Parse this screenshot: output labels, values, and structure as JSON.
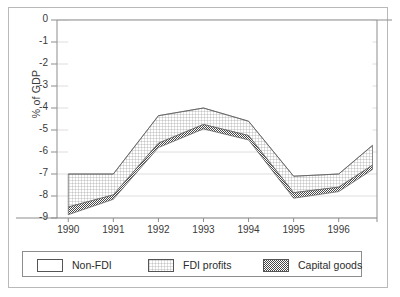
{
  "chart_data": {
    "type": "area",
    "title": "",
    "subtitle": "",
    "xlabel": "",
    "ylabel": "% of GDP",
    "xlim": [
      1989.75,
      1996.85
    ],
    "ylim": [
      -9,
      0
    ],
    "y_ticks": [
      "0",
      "-1",
      "-2",
      "-3",
      "-4",
      "-5",
      "-6",
      "-7",
      "-8",
      "-9"
    ],
    "y_tick_values": [
      0,
      -1,
      -2,
      -3,
      -4,
      -5,
      -6,
      -7,
      -8,
      -9
    ],
    "x_ticks": [
      "1990",
      "1991",
      "1992",
      "1993",
      "1994",
      "1995",
      "1996"
    ],
    "x_tick_values": [
      1990,
      1991,
      1992,
      1993,
      1994,
      1995,
      1996
    ],
    "grid": "horizontal",
    "legend_position": "bottom",
    "stacking": "cumulative-negative",
    "note": "Boundaries are cumulative totals. Non-FDI is the region from 0 down to boundary_top; FDI profits is between boundary_top and boundary_mid; Capital goods is between boundary_mid and boundary_bottom.",
    "x": [
      1990,
      1991,
      1992,
      1993,
      1994,
      1995,
      1996,
      1996.75
    ],
    "series": [
      {
        "name": "Non-FDI",
        "pattern": "blank",
        "boundary_label": "boundary_top",
        "boundary_values": [
          -7.0,
          -7.0,
          -4.35,
          -4.0,
          -4.6,
          -7.1,
          -7.0,
          -5.7
        ]
      },
      {
        "name": "FDI profits",
        "pattern": "fine-grid",
        "boundary_label": "boundary_mid",
        "boundary_values": [
          -8.5,
          -7.95,
          -5.6,
          -4.75,
          -5.25,
          -7.85,
          -7.6,
          -6.6
        ]
      },
      {
        "name": "Capital goods",
        "pattern": "dense-checker",
        "boundary_label": "boundary_bottom",
        "boundary_values": [
          -8.85,
          -8.15,
          -5.8,
          -4.95,
          -5.45,
          -8.1,
          -7.8,
          -6.8
        ]
      }
    ]
  },
  "legend": {
    "items": [
      {
        "label": "Non-FDI",
        "pattern": "blank"
      },
      {
        "label": "FDI profits",
        "pattern": "fine-grid"
      },
      {
        "label": "Capital goods",
        "pattern": "dense-checker"
      }
    ]
  },
  "colors": {
    "axis": "#9a9a9a",
    "grid": "#d5d5d5",
    "text": "#3a3a3a",
    "frame": "#b9b9b9",
    "legend_border": "#8d8d8d",
    "band_outline": "#5a5a5a",
    "background": "#ffffff"
  }
}
